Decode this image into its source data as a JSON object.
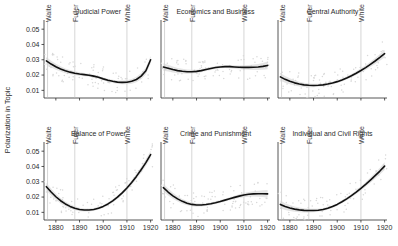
{
  "figure": {
    "ylabel": "Polarization in Topic",
    "background": "#ffffff",
    "line_color": "#111111",
    "band_color": "#cfcfcf",
    "ref_line_color": "#b9b9b9"
  },
  "chart_data": {
    "type": "line",
    "title": "",
    "xlabel": "",
    "ylabel": "Polarization in Topic",
    "xlim": [
      1875,
      1921
    ],
    "ylim": [
      0.005,
      0.056
    ],
    "xticks": [
      1880,
      1890,
      1900,
      1910,
      1920
    ],
    "xtick_labels": [
      "1880",
      "1890",
      "1900",
      "1910",
      "1920"
    ],
    "yticks": [
      0.01,
      0.02,
      0.03,
      0.04,
      0.05
    ],
    "ytick_labels": [
      "0.01",
      "0.02",
      "0.03",
      "0.04",
      "0.05"
    ],
    "grid": false,
    "legend": "none",
    "annotations": [
      {
        "label": "Waite",
        "x": 1876.5,
        "type": "vertical-reference-line"
      },
      {
        "label": "Fuller",
        "x": 1888.0,
        "type": "vertical-reference-line"
      },
      {
        "label": "White",
        "x": 1910.0,
        "type": "vertical-reference-line"
      }
    ],
    "panels": [
      {
        "title": "Judicial Power",
        "row": 0,
        "col": 0,
        "x": [
          1876,
          1878,
          1880,
          1882,
          1884,
          1886,
          1888,
          1890,
          1892,
          1894,
          1896,
          1898,
          1900,
          1902,
          1904,
          1906,
          1908,
          1910,
          1912,
          1914,
          1916,
          1918,
          1920
        ],
        "values": [
          0.0293,
          0.0272,
          0.0254,
          0.024,
          0.0228,
          0.0219,
          0.0212,
          0.0207,
          0.0203,
          0.0199,
          0.0193,
          0.0185,
          0.0175,
          0.0166,
          0.0159,
          0.0154,
          0.0152,
          0.0153,
          0.0159,
          0.0171,
          0.0193,
          0.0228,
          0.03
        ]
      },
      {
        "title": "Economics and Business",
        "row": 0,
        "col": 1,
        "x": [
          1876,
          1878,
          1880,
          1882,
          1884,
          1886,
          1888,
          1890,
          1892,
          1894,
          1896,
          1898,
          1900,
          1902,
          1904,
          1906,
          1908,
          1910,
          1912,
          1914,
          1916,
          1918,
          1920
        ],
        "values": [
          0.0253,
          0.0245,
          0.0236,
          0.0229,
          0.0225,
          0.0222,
          0.0222,
          0.0224,
          0.0229,
          0.0236,
          0.0243,
          0.0249,
          0.0253,
          0.0255,
          0.0255,
          0.0253,
          0.0251,
          0.025,
          0.025,
          0.0251,
          0.0253,
          0.0257,
          0.0263
        ]
      },
      {
        "title": "Central Authority",
        "row": 0,
        "col": 2,
        "x": [
          1876,
          1878,
          1880,
          1882,
          1884,
          1886,
          1888,
          1890,
          1892,
          1894,
          1896,
          1898,
          1900,
          1902,
          1904,
          1906,
          1908,
          1910,
          1912,
          1914,
          1916,
          1918,
          1920
        ],
        "values": [
          0.0188,
          0.0172,
          0.0159,
          0.0149,
          0.0141,
          0.0136,
          0.0133,
          0.0132,
          0.0133,
          0.0136,
          0.0141,
          0.0148,
          0.0157,
          0.0168,
          0.0181,
          0.0196,
          0.0212,
          0.023,
          0.0249,
          0.027,
          0.0292,
          0.0315,
          0.034
        ]
      },
      {
        "title": "Balance of Power",
        "row": 1,
        "col": 0,
        "x": [
          1876,
          1878,
          1880,
          1882,
          1884,
          1886,
          1888,
          1890,
          1892,
          1894,
          1896,
          1898,
          1900,
          1902,
          1904,
          1906,
          1908,
          1910,
          1912,
          1914,
          1916,
          1918,
          1920
        ],
        "values": [
          0.0268,
          0.0233,
          0.0202,
          0.0176,
          0.0155,
          0.0139,
          0.0127,
          0.0119,
          0.0115,
          0.0115,
          0.0119,
          0.0127,
          0.0139,
          0.0155,
          0.0175,
          0.0199,
          0.0227,
          0.0259,
          0.0295,
          0.0335,
          0.0379,
          0.0425,
          0.0478
        ]
      },
      {
        "title": "Crime and Punishment",
        "row": 1,
        "col": 1,
        "x": [
          1876,
          1878,
          1880,
          1882,
          1884,
          1886,
          1888,
          1890,
          1892,
          1894,
          1896,
          1898,
          1900,
          1902,
          1904,
          1906,
          1908,
          1910,
          1912,
          1914,
          1916,
          1918,
          1920
        ],
        "values": [
          0.0262,
          0.0233,
          0.0208,
          0.0188,
          0.0172,
          0.016,
          0.0152,
          0.0148,
          0.0148,
          0.0151,
          0.0156,
          0.0163,
          0.0171,
          0.018,
          0.0189,
          0.0198,
          0.0206,
          0.0213,
          0.0218,
          0.0221,
          0.0222,
          0.0222,
          0.0221
        ]
      },
      {
        "title": "Individual and Civil Rights",
        "row": 1,
        "col": 2,
        "x": [
          1876,
          1878,
          1880,
          1882,
          1884,
          1886,
          1888,
          1890,
          1892,
          1894,
          1896,
          1898,
          1900,
          1902,
          1904,
          1906,
          1908,
          1910,
          1912,
          1914,
          1916,
          1918,
          1920
        ],
        "values": [
          0.0152,
          0.0138,
          0.0128,
          0.0121,
          0.0116,
          0.0113,
          0.0112,
          0.0112,
          0.0114,
          0.0119,
          0.0127,
          0.0138,
          0.0152,
          0.0169,
          0.0188,
          0.0209,
          0.0232,
          0.0257,
          0.0283,
          0.0311,
          0.034,
          0.037,
          0.0402
        ]
      }
    ]
  }
}
